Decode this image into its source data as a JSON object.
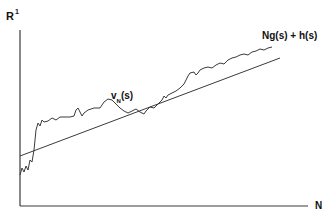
{
  "figure": {
    "y_axis_label": "R",
    "y_axis_superscript": "1",
    "x_axis_label": "N",
    "line_label": "Ng(s) + h(s)",
    "curve_label_main": "v",
    "curve_label_sub": "N",
    "curve_label_tail": "(s)"
  },
  "colors": {
    "ink": "#3a3a3a",
    "background": "#ffffff"
  },
  "geometry": {
    "axes": {
      "origin": [
        20,
        206
      ],
      "y_top": [
        20,
        30
      ],
      "x_right": [
        308,
        206
      ]
    },
    "line": {
      "from": [
        20,
        156
      ],
      "to": [
        280,
        58
      ]
    },
    "curve_points": "20,175 22,168 24,172 26,166 28,170 30,160 32,162 34,150 36,130 38,123 40,126 42,120 44,122 48,121 52,118 56,120 60,117 64,117 70,117 74,116 76,110 78,108 80,112 82,116 84,113 88,110 94,108 100,108 104,102 108,99 112,100 116,104 120,108 124,111 128,113 132,111 136,109 140,112 144,114 146,111 150,107 154,108 158,104 162,100 164,96 166,98 168,95 172,93 176,91 180,88 182,86 184,84 186,80 188,76 190,73 194,72 196,75 198,73 200,70 204,68 208,67 212,68 216,65 220,63 224,64 228,60 232,58 236,57 240,55 244,54 248,55 252,52 256,51 260,49 264,50 268,48 272,47"
  }
}
